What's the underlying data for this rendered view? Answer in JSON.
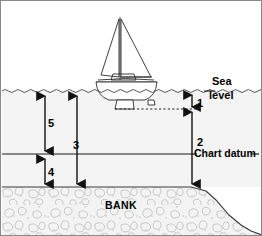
{
  "diagram": {
    "labels": {
      "sea": "Sea",
      "level": "level",
      "chart_datum": "Chart datum",
      "bank": "BANK"
    },
    "measurements": [
      {
        "id": "1",
        "label": "1",
        "name": "draught-above-keel-to-sea-level"
      },
      {
        "id": "2",
        "label": "2",
        "name": "depth-below-keel-to-bank"
      },
      {
        "id": "3",
        "label": "3",
        "name": "total-depth-of-water"
      },
      {
        "id": "4",
        "label": "4",
        "name": "charted-depth-below-datum"
      },
      {
        "id": "5",
        "label": "5",
        "name": "height-of-tide-above-datum"
      }
    ],
    "colors": {
      "border": "#8a8a8a",
      "water_fill": "#f4f4f4",
      "bank_fill": "#f2f2f2",
      "line": "#1a1a1a",
      "sky": "#ffffff",
      "seabed_stroke": "#b9b9b9"
    },
    "geometry": {
      "sea_level_y": 90,
      "chart_datum_y": 153,
      "bank_top_y": 186,
      "keel_bottom_y": 108,
      "slope_start_x": 190
    }
  }
}
